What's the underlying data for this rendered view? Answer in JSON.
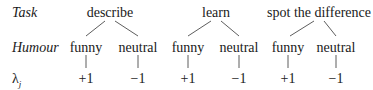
{
  "row_labels": {
    "task": "Task",
    "humour": "Humour",
    "lambda": "λ",
    "lambda_sub": "j"
  },
  "tasks": [
    {
      "name": "describe",
      "x": 110,
      "children": [
        {
          "label": "funny",
          "x": 86,
          "value": "+1"
        },
        {
          "label": "neutral",
          "x": 138,
          "value": "−1"
        }
      ]
    },
    {
      "name": "learn",
      "x": 216,
      "children": [
        {
          "label": "funny",
          "x": 188,
          "value": "+1"
        },
        {
          "label": "neutral",
          "x": 239,
          "value": "−1"
        }
      ]
    },
    {
      "name": "spot the difference",
      "x": 319,
      "children": [
        {
          "label": "funny",
          "x": 288,
          "value": "+1"
        },
        {
          "label": "neutral",
          "x": 336,
          "value": "−1"
        }
      ]
    }
  ]
}
